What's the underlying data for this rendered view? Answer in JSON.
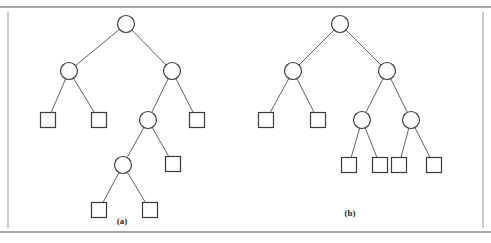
{
  "figure": {
    "type": "diagram",
    "background_color": "#ffffff",
    "stroke_color": "#3a3a3a",
    "rule_color": "#8a8a8a",
    "frame": {
      "top_rule": {
        "x1": 0,
        "y1": 7,
        "x2": 491,
        "y2": 7
      },
      "bottom_rule": {
        "x1": 0,
        "y1": 232,
        "x2": 491,
        "y2": 232
      },
      "left_rule": {
        "x1": 8,
        "y1": 12,
        "x2": 8,
        "y2": 228
      },
      "right_rule": {
        "x1": 483,
        "y1": 12,
        "x2": 483,
        "y2": 228
      }
    },
    "captions": [
      {
        "id": "caption-a",
        "text": "(a)",
        "x": 122,
        "y": 224
      },
      {
        "id": "caption-b",
        "text": "(b)",
        "x": 350,
        "y": 216
      }
    ],
    "trees": [
      {
        "id": "tree-a",
        "label": "(a)",
        "node_radius": 8.5,
        "square_size": 15,
        "nodes": [
          {
            "id": "a-n0",
            "shape": "circle",
            "x": 126,
            "y": 24,
            "level": 0,
            "role": "root"
          },
          {
            "id": "a-n1",
            "shape": "circle",
            "x": 69,
            "y": 71,
            "level": 1,
            "role": "internal"
          },
          {
            "id": "a-n2",
            "shape": "circle",
            "x": 172,
            "y": 71,
            "level": 1,
            "role": "internal"
          },
          {
            "id": "a-n3",
            "shape": "square",
            "x": 48,
            "y": 120,
            "level": 2,
            "role": "leaf"
          },
          {
            "id": "a-n4",
            "shape": "square",
            "x": 99,
            "y": 120,
            "level": 2,
            "role": "leaf"
          },
          {
            "id": "a-n5",
            "shape": "circle",
            "x": 148,
            "y": 120,
            "level": 2,
            "role": "internal"
          },
          {
            "id": "a-n6",
            "shape": "square",
            "x": 197,
            "y": 120,
            "level": 2,
            "role": "leaf"
          },
          {
            "id": "a-n7",
            "shape": "circle",
            "x": 123,
            "y": 165,
            "level": 3,
            "role": "internal"
          },
          {
            "id": "a-n8",
            "shape": "square",
            "x": 173,
            "y": 164,
            "level": 3,
            "role": "leaf"
          },
          {
            "id": "a-n9",
            "shape": "square",
            "x": 99,
            "y": 210,
            "level": 4,
            "role": "leaf"
          },
          {
            "id": "a-n10",
            "shape": "square",
            "x": 150,
            "y": 210,
            "level": 4,
            "role": "leaf"
          }
        ],
        "edges": [
          {
            "from": "a-n0",
            "to": "a-n1"
          },
          {
            "from": "a-n0",
            "to": "a-n2"
          },
          {
            "from": "a-n1",
            "to": "a-n3"
          },
          {
            "from": "a-n1",
            "to": "a-n4"
          },
          {
            "from": "a-n2",
            "to": "a-n5"
          },
          {
            "from": "a-n2",
            "to": "a-n6"
          },
          {
            "from": "a-n5",
            "to": "a-n7"
          },
          {
            "from": "a-n5",
            "to": "a-n8"
          },
          {
            "from": "a-n7",
            "to": "a-n9"
          },
          {
            "from": "a-n7",
            "to": "a-n10"
          }
        ]
      },
      {
        "id": "tree-b",
        "label": "(b)",
        "node_radius": 8.5,
        "square_size": 15,
        "nodes": [
          {
            "id": "b-n0",
            "shape": "circle",
            "x": 340,
            "y": 24,
            "level": 0,
            "role": "root"
          },
          {
            "id": "b-n1",
            "shape": "circle",
            "x": 293,
            "y": 71,
            "level": 1,
            "role": "internal"
          },
          {
            "id": "b-n2",
            "shape": "circle",
            "x": 387,
            "y": 71,
            "level": 1,
            "role": "internal"
          },
          {
            "id": "b-n3",
            "shape": "square",
            "x": 266,
            "y": 120,
            "level": 2,
            "role": "leaf"
          },
          {
            "id": "b-n4",
            "shape": "square",
            "x": 318,
            "y": 120,
            "level": 2,
            "role": "leaf"
          },
          {
            "id": "b-n5",
            "shape": "circle",
            "x": 362,
            "y": 120,
            "level": 2,
            "role": "internal"
          },
          {
            "id": "b-n6",
            "shape": "circle",
            "x": 411,
            "y": 120,
            "level": 2,
            "role": "internal"
          },
          {
            "id": "b-n7",
            "shape": "square",
            "x": 349,
            "y": 165,
            "level": 3,
            "role": "leaf"
          },
          {
            "id": "b-n8",
            "shape": "square",
            "x": 380,
            "y": 165,
            "level": 3,
            "role": "leaf"
          },
          {
            "id": "b-n9",
            "shape": "square",
            "x": 399,
            "y": 165,
            "level": 3,
            "role": "leaf"
          },
          {
            "id": "b-n10",
            "shape": "square",
            "x": 434,
            "y": 165,
            "level": 3,
            "role": "leaf"
          }
        ],
        "edges": [
          {
            "from": "b-n0",
            "to": "b-n1"
          },
          {
            "from": "b-n0",
            "to": "b-n2"
          },
          {
            "from": "b-n1",
            "to": "b-n3"
          },
          {
            "from": "b-n1",
            "to": "b-n4"
          },
          {
            "from": "b-n2",
            "to": "b-n5"
          },
          {
            "from": "b-n2",
            "to": "b-n6"
          },
          {
            "from": "b-n5",
            "to": "b-n7"
          },
          {
            "from": "b-n5",
            "to": "b-n8"
          },
          {
            "from": "b-n6",
            "to": "b-n9"
          },
          {
            "from": "b-n6",
            "to": "b-n10"
          }
        ]
      }
    ]
  }
}
